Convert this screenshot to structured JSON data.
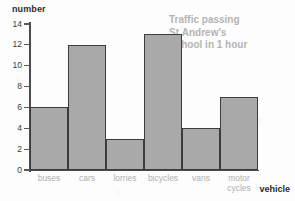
{
  "chart_data": {
    "type": "bar",
    "title": "Traffic passing St.Andrew's School in 1 hour",
    "title_lines": [
      "Traffic passing",
      "St.Andrew's",
      "School in 1 hour"
    ],
    "xlabel": "vehicle",
    "ylabel": "number",
    "categories": [
      "buses",
      "cars",
      "lorries",
      "bicycles",
      "vans",
      "motor\ncycles"
    ],
    "values": [
      6,
      12,
      3,
      13,
      4,
      7
    ],
    "ylim": [
      0,
      14
    ],
    "yticks": [
      0,
      2,
      4,
      6,
      8,
      10,
      12,
      14
    ],
    "ytick_labels": [
      "0",
      "2",
      "4",
      "6",
      "8",
      "10",
      "12",
      "14"
    ],
    "grid": false,
    "legend": false,
    "bars_contiguous": true,
    "colors": {
      "bar_fill": "#a9a9a9",
      "bar_edge": "#3c3c3c",
      "axis": "#4a4a4a",
      "title_text": "#b4b4b4",
      "category_text": "#b0b0b0",
      "axis_title_text": "#2b2b2b",
      "background": "#fdfdfd"
    }
  }
}
